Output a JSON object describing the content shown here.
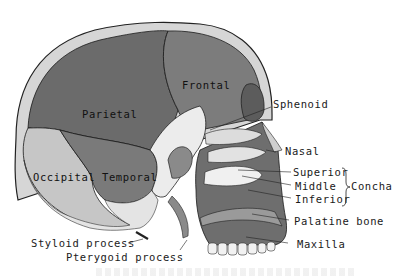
{
  "figure": {
    "type": "anatomical-illustration",
    "colors": {
      "background": "#ffffff",
      "parietal": "#6b6b6b",
      "frontal": "#7c7c7c",
      "occipital": "#c4c4c4",
      "temporal": "#7a7a7a",
      "maxilla": "#6e6e6e",
      "bone_edge": "#d9d9d9",
      "label_text": "#1a1a1a"
    },
    "labels": {
      "parietal": "Parietal",
      "frontal": "Frontal",
      "occipital": "Occipital",
      "temporal": "Temporal",
      "sphenoid": "Sphenoid",
      "nasal": "Nasal",
      "concha_superior": "Superior",
      "concha_middle": "Middle",
      "concha_inferior": "Inferior",
      "concha": "Concha",
      "palatine": "Palatine bone",
      "maxilla": "Maxilla",
      "styloid": "Styloid process",
      "pterygoid": "Pterygoid process"
    }
  }
}
